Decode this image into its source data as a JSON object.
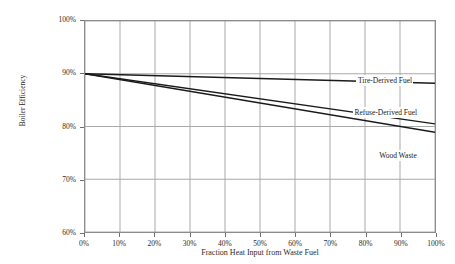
{
  "chart_data": {
    "type": "line",
    "title": "",
    "xlabel": "Fraction Heat Input from Waste Fuel",
    "ylabel": "Boiler Efficiency",
    "xlim": [
      0,
      100
    ],
    "ylim": [
      60,
      100
    ],
    "grid": true,
    "legend_position": "inline-right-of-series",
    "x_ticks": [
      "0%",
      "10%",
      "20%",
      "30%",
      "40%",
      "50%",
      "60%",
      "70%",
      "80%",
      "90%",
      "100%"
    ],
    "y_ticks": [
      "60%",
      "70%",
      "80%",
      "90%",
      "100%"
    ],
    "x_tick_values": [
      0,
      10,
      20,
      30,
      40,
      50,
      60,
      70,
      80,
      90,
      100
    ],
    "y_tick_values": [
      60,
      70,
      80,
      90,
      100
    ],
    "x": [
      0,
      100
    ],
    "series": [
      {
        "name": "Tire-Derived Fuel",
        "values": [
          90.0,
          88.2
        ],
        "color": "#1a1a1a",
        "label_x": 77,
        "label_y": 88.9
      },
      {
        "name": "Refuse-Derived Fuel",
        "values": [
          90.0,
          80.5
        ],
        "color": "#1a1a1a",
        "label_x": 76,
        "label_y": 83.0
      },
      {
        "name": "Wood Waste",
        "values": [
          90.0,
          78.9
        ],
        "color": "#1a1a1a",
        "label_x": 83,
        "label_y": 74.8
      }
    ]
  },
  "axes": {
    "y_title": "Boiler Efficiency",
    "x_title": "Fraction Heat Input from Waste Fuel",
    "y_labels": [
      "100%",
      "90%",
      "80%",
      "70%",
      "60%"
    ],
    "x_labels": [
      "0%",
      "10%",
      "20%",
      "30%",
      "40%",
      "50%",
      "60%",
      "70%",
      "80%",
      "90%",
      "100%"
    ]
  },
  "colors": {
    "line": "#1a1a1a",
    "grid": "#a8a8a8",
    "border": "#8c8c8c",
    "background": "#ffffff",
    "text": "#2b2b2b"
  }
}
